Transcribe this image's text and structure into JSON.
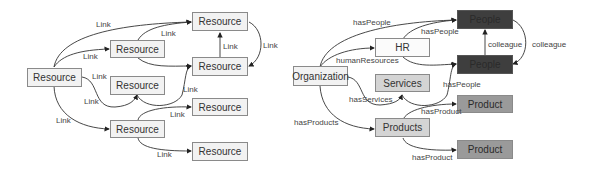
{
  "left_diagram": {
    "nodes": [
      {
        "id": "root",
        "label": "Resource"
      },
      {
        "id": "r1",
        "label": "Resource"
      },
      {
        "id": "rtop",
        "label": "Resource"
      },
      {
        "id": "rmr",
        "label": "Resource"
      },
      {
        "id": "rcenter",
        "label": "Resource"
      },
      {
        "id": "rlr",
        "label": "Resource"
      },
      {
        "id": "rbm",
        "label": "Resource"
      },
      {
        "id": "rbr",
        "label": "Resource"
      }
    ],
    "edge_labels": [
      "Link",
      "Link",
      "Link",
      "Link",
      "Link",
      "Link",
      "Link",
      "Link",
      "Link",
      "Link",
      "Link",
      "Link"
    ]
  },
  "right_diagram": {
    "nodes": [
      {
        "id": "org",
        "label": "Organization"
      },
      {
        "id": "hr",
        "label": "HR"
      },
      {
        "id": "people1",
        "label": "People"
      },
      {
        "id": "people2",
        "label": "People"
      },
      {
        "id": "services",
        "label": "Services"
      },
      {
        "id": "product1",
        "label": "Product"
      },
      {
        "id": "products",
        "label": "Products"
      },
      {
        "id": "product2",
        "label": "Product"
      }
    ],
    "edge_labels": {
      "hasPeople_top": "hasPeople",
      "hr_hasPeople": "hasPeople",
      "humanResources": "humanResources",
      "colleague_inner": "colleague",
      "colleague_outer": "colleague",
      "hasServices": "hasServices",
      "services_hasPeople": "hasPeople",
      "hasProduct_top": "hasProduct",
      "hasProducts": "hasProducts",
      "hasProduct_bottom": "hasProduct"
    }
  },
  "colors": {
    "people_fill": "#3e3e3e",
    "product_fill": "#9a9a9a",
    "services_fill": "#d4d4d4",
    "default_fill": "#f2f2f2",
    "edge": "#333333"
  }
}
